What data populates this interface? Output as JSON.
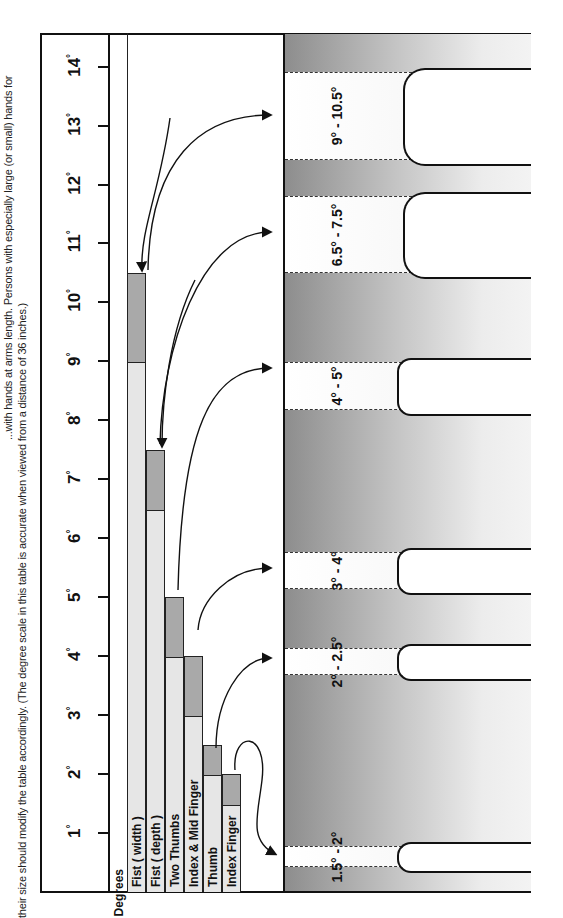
{
  "caption": {
    "line1": "...with hands at arms length. Persons with especially large (or small) hands for",
    "line2": "their size should modify the table accordingly. (The degree scale in this table is accurate when viewed from a distance of 36 inches.)"
  },
  "scale": {
    "header": "Degrees",
    "ticks": [
      {
        "value": "1",
        "y": 833
      },
      {
        "value": "2",
        "y": 774
      },
      {
        "value": "3",
        "y": 715
      },
      {
        "value": "4",
        "y": 656
      },
      {
        "value": "5",
        "y": 597
      },
      {
        "value": "6",
        "y": 538
      },
      {
        "value": "7",
        "y": 479
      },
      {
        "value": "8",
        "y": 420
      },
      {
        "value": "9",
        "y": 361
      },
      {
        "value": "10",
        "y": 302
      },
      {
        "value": "11",
        "y": 243
      },
      {
        "value": "12",
        "y": 185
      },
      {
        "value": "13",
        "y": 126
      },
      {
        "value": "14",
        "y": 67
      }
    ],
    "degree_symbol": "°"
  },
  "chart_data": {
    "type": "bar",
    "xlabel": "",
    "ylabel": "Degrees",
    "ylim": [
      0,
      14
    ],
    "categories": [
      "Fist ( width )",
      "Fist ( depth )",
      "Two Thumbs",
      "Index & Mid Finger",
      "Thumb",
      "Index Finger"
    ],
    "series": [
      {
        "name": "minimum",
        "values": [
          9,
          6.5,
          4,
          3,
          2,
          1.5
        ]
      },
      {
        "name": "maximum",
        "values": [
          10.5,
          7.5,
          5,
          4,
          2.5,
          2
        ]
      }
    ],
    "range_labels": [
      "9° - 10.5°",
      "6.5° - 7.5°",
      "4° - 5°",
      "3° - 4°",
      "2° - 2.5°",
      "1.5° - 2°"
    ],
    "grid": false,
    "legend": "none"
  },
  "bars": [
    {
      "label": "Fist ( width )",
      "min": 9,
      "max": 10.5,
      "x": 127
    },
    {
      "label": "Fist ( depth )",
      "min": 6.5,
      "max": 7.5,
      "x": 146
    },
    {
      "label": "Two Thumbs",
      "min": 4,
      "max": 5,
      "x": 165
    },
    {
      "label": "Index & Mid Finger",
      "min": 3,
      "max": 4,
      "x": 184
    },
    {
      "label": "Thumb",
      "min": 2,
      "max": 2.5,
      "x": 203
    },
    {
      "label": "Index Finger",
      "min": 1.5,
      "max": 2,
      "x": 222
    }
  ],
  "illustrations": [
    {
      "label": "9° - 10.5°",
      "gesture": "fist-width",
      "top": 72,
      "bottom": 158
    },
    {
      "label": "6.5° - 7.5°",
      "gesture": "fist-depth",
      "top": 196,
      "bottom": 271
    },
    {
      "label": "4° - 5°",
      "gesture": "two-thumbs",
      "top": 362,
      "bottom": 408
    },
    {
      "label": "3° - 4°",
      "gesture": "index-mid-finger",
      "top": 552,
      "bottom": 587
    },
    {
      "label": "2° - 2.5°",
      "gesture": "thumb",
      "top": 648,
      "bottom": 673
    },
    {
      "label": "1.5° - 2°",
      "gesture": "index-finger",
      "top": 846,
      "bottom": 865
    }
  ],
  "colors": {
    "bar_light": "#e6e6e6",
    "bar_dark": "#a9a9a9",
    "band_dark": "#8d8d8d",
    "line": "#111111"
  }
}
